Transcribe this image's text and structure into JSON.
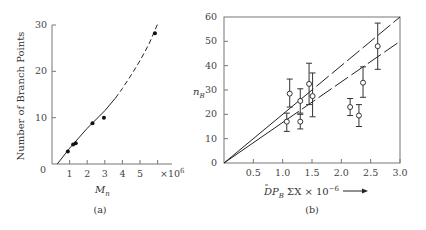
{
  "chart_data": [
    {
      "panel": "(a)",
      "type": "scatter",
      "title": "",
      "xlabel": "M_n",
      "ylabel": "Number of Branch Points",
      "x_multiplier_label": "×10^6",
      "xlim": [
        0,
        6
      ],
      "ylim": [
        0,
        30
      ],
      "x_ticks": [
        "1",
        "2",
        "3",
        "4",
        "5",
        "6"
      ],
      "y_ticks": [
        "0",
        "10",
        "20",
        "30"
      ],
      "grid": false,
      "points": [
        {
          "x": 0.9,
          "y": 2.7
        },
        {
          "x": 1.2,
          "y": 4.2
        },
        {
          "x": 1.35,
          "y": 4.5
        },
        {
          "x": 2.3,
          "y": 8.8
        },
        {
          "x": 2.95,
          "y": 10.0
        },
        {
          "x": 5.85,
          "y": 28.2
        }
      ],
      "fit_curve": {
        "solid": [
          [
            0.3,
            0
          ],
          [
            1,
            3.4
          ],
          [
            2,
            7.7
          ],
          [
            3,
            11.5
          ],
          [
            3.6,
            14.2
          ]
        ],
        "dashed": [
          [
            3.6,
            14.2
          ],
          [
            4,
            16.3
          ],
          [
            4.5,
            19.2
          ],
          [
            5,
            22.3
          ],
          [
            5.5,
            25.8
          ],
          [
            6,
            30.2
          ]
        ]
      }
    },
    {
      "panel": "(b)",
      "type": "scatter",
      "title": "",
      "xlabel": "DP_B ΣX × 10^-6 →",
      "ylabel": "n_B",
      "xlim": [
        0,
        3.0
      ],
      "ylim": [
        0,
        60
      ],
      "x_ticks": [
        "0.5",
        "1.0",
        "1.5",
        "2.0",
        "2.5",
        "3.0"
      ],
      "y_ticks": [
        "0",
        "10",
        "20",
        "30",
        "40",
        "50",
        "60"
      ],
      "grid": false,
      "points": [
        {
          "x": 1.07,
          "y": 17,
          "err_low": 13,
          "err_high": 20.5
        },
        {
          "x": 1.12,
          "y": 28.5,
          "err_low": 23,
          "err_high": 34.5
        },
        {
          "x": 1.3,
          "y": 25.5,
          "err_low": 20.5,
          "err_high": 30.5
        },
        {
          "x": 1.3,
          "y": 17,
          "err_low": 14,
          "err_high": 20
        },
        {
          "x": 1.45,
          "y": 32.5,
          "err_low": 24,
          "err_high": 41
        },
        {
          "x": 1.51,
          "y": 27.5,
          "err_low": 19,
          "err_high": 37
        },
        {
          "x": 2.15,
          "y": 23,
          "err_low": 19.5,
          "err_high": 26.5
        },
        {
          "x": 2.3,
          "y": 19.5,
          "err_low": 15,
          "err_high": 24
        },
        {
          "x": 2.37,
          "y": 33,
          "err_low": 27,
          "err_high": 39.5
        },
        {
          "x": 2.62,
          "y": 48,
          "err_low": 38.5,
          "err_high": 57.5
        }
      ],
      "lines": [
        {
          "name": "upper",
          "from": [
            0,
            0
          ],
          "to": [
            3.0,
            60
          ],
          "style": "solid-then-dashed"
        },
        {
          "name": "lower",
          "from": [
            0,
            0
          ],
          "to": [
            3.0,
            50
          ],
          "style": "solid-then-dashed"
        }
      ]
    }
  ],
  "captions": {
    "a": "(a)",
    "b": "(b)"
  },
  "labels": {
    "a_ylabel": "Number of Branch Points",
    "a_xlabel_main": "M",
    "a_xlabel_sub": "n",
    "a_mult": "×10",
    "a_mult_exp": "6",
    "a_zero": "0",
    "b_ylabel_main": "n",
    "b_ylabel_sub": "B",
    "b_xlabel_main": "DP",
    "b_xlabel_sub": "B",
    "b_xlabel_rest": " ΣX × 10",
    "b_xlabel_exp": "−6"
  }
}
